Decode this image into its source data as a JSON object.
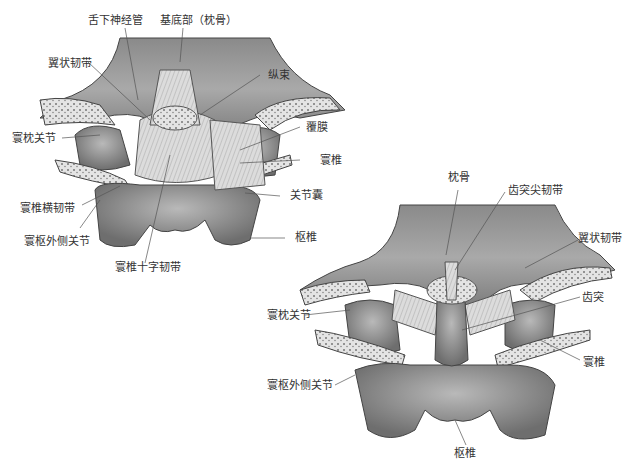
{
  "figure_left": {
    "title": "寰枢关节后面观（上）",
    "labels": {
      "hypoglossal_canal": "舌下神经管",
      "basilar_part": "基底部（枕骨）",
      "alar_ligament": "翼状韧带",
      "longitudinal_band": "纵束",
      "tectorial_membrane": "覆膜",
      "atlanto_occipital_joint": "寰枕关节",
      "atlas": "寰椎",
      "joint_capsule": "关节囊",
      "transverse_ligament": "寰椎横韧带",
      "lateral_atlantoaxial_joint": "寰枢外侧关节",
      "axis": "枢椎",
      "cruciate_ligament": "寰椎十字韧带"
    }
  },
  "figure_right": {
    "labels": {
      "occipital_bone": "枕骨",
      "apical_ligament": "齿突尖韧带",
      "alar_ligament": "翼状韧带",
      "dens": "齿突",
      "atlanto_occipital_joint": "寰枕关节",
      "atlas": "寰椎",
      "lateral_atlantoaxial_joint": "寰枢外侧关节",
      "axis": "枢椎"
    }
  },
  "colors": {
    "bone_dark": "#6e6e6e",
    "bone_mid": "#9a9a9a",
    "bone_light": "#c8c8c8",
    "ligament": "#d9d9d9",
    "leader_line": "#555555"
  }
}
